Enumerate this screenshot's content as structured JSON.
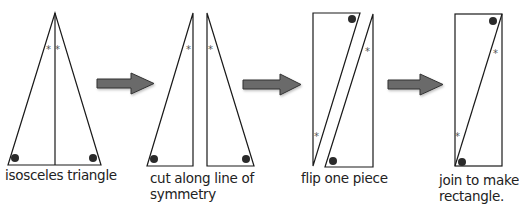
{
  "diagram": {
    "steps": [
      {
        "id": "step1",
        "caption_lines": [
          "isosceles triangle"
        ]
      },
      {
        "id": "step2",
        "caption_lines": [
          "cut along line of",
          "symmetry"
        ]
      },
      {
        "id": "step3",
        "caption_lines": [
          "flip one piece"
        ]
      },
      {
        "id": "step4",
        "caption_lines": [
          "join to make",
          "rectangle."
        ]
      }
    ],
    "markers": {
      "angle_mark": "*",
      "corner_dot": "●"
    },
    "colors": {
      "line": "#1a1a1a",
      "arrow_fill": "#6b6b6b",
      "arrow_stroke": "#333333",
      "dot": "#2a2a2a",
      "star": "#555555",
      "text": "#222222",
      "background": "#ffffff"
    }
  }
}
